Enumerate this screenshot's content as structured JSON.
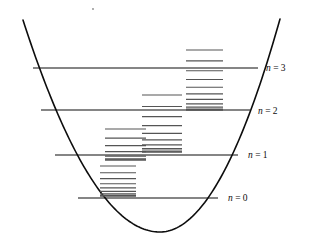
{
  "figure": {
    "background_color": "#ffffff",
    "stroke_color": "#0d0d0d",
    "sublevel_color": "#555555",
    "width": 309,
    "height": 239
  },
  "chart_data": {
    "type": "line",
    "xlabel": "",
    "ylabel": "",
    "xlim": [
      0,
      309
    ],
    "ylim": [
      239,
      0
    ],
    "grid": false,
    "legend": "none",
    "annotations": [
      "n = 3",
      "n = 2",
      "n = 1",
      "n = 0"
    ],
    "series": [
      {
        "name": "potential-curve",
        "kind": "parabola",
        "vertex": [
          160,
          232
        ],
        "left_end": [
          23,
          20
        ],
        "right_end": [
          280,
          19
        ],
        "stroke_width": 1.6
      }
    ],
    "energy_levels": [
      {
        "label": "n = 0",
        "quantum_number": 0,
        "y": 198,
        "x_start": 78,
        "x_end": 218,
        "label_x": 228,
        "label_y": 201,
        "sublevels": {
          "x_start": 100,
          "x_end": 136,
          "count": 9,
          "top_y": 166,
          "bottom_y": 196,
          "spacing_mode": "converging-downward"
        }
      },
      {
        "label": "n = 1",
        "quantum_number": 1,
        "y": 155,
        "x_start": 55,
        "x_end": 238,
        "label_x": 248,
        "label_y": 158,
        "sublevels": {
          "x_start": 105,
          "x_end": 146,
          "count": 7,
          "top_y": 129,
          "bottom_y": 160,
          "spacing_mode": "converging-downward"
        }
      },
      {
        "label": "n = 2",
        "quantum_number": 2,
        "y": 110,
        "x_start": 41,
        "x_end": 250,
        "label_x": 258,
        "label_y": 114,
        "sublevels": {
          "x_start": 142,
          "x_end": 182,
          "count": 10,
          "top_y": 95,
          "bottom_y": 152,
          "spacing_mode": "converging-downward"
        }
      },
      {
        "label": "n = 3",
        "quantum_number": 3,
        "y": 68,
        "x_start": 33,
        "x_end": 258,
        "label_x": 266,
        "label_y": 71,
        "sublevels": {
          "x_start": 186,
          "x_end": 223,
          "count": 11,
          "top_y": 50,
          "bottom_y": 110,
          "spacing_mode": "converging-downward"
        }
      }
    ],
    "labels": [
      {
        "text": "n = 0",
        "variable": "n",
        "value": "0",
        "x": 228,
        "y": 201
      },
      {
        "text": "n = 1",
        "variable": "n",
        "value": "1",
        "x": 248,
        "y": 158
      },
      {
        "text": "n = 2",
        "variable": "n",
        "value": "2",
        "x": 258,
        "y": 114
      },
      {
        "text": "n = 3",
        "variable": "n",
        "value": "3",
        "x": 266,
        "y": 71
      }
    ],
    "speck": {
      "x": 93,
      "y": 9,
      "r": 0.9
    }
  }
}
